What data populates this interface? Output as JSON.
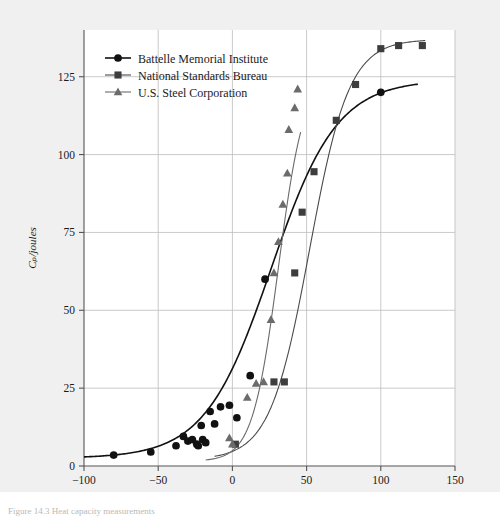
{
  "figure": {
    "background_color": "#f0f0f0",
    "plot_background_color": "#ffffff",
    "caption": "Figure 14.3   Heat capacity measurements"
  },
  "chart_data": {
    "type": "scatter",
    "title": "",
    "xlabel": "temperature/°C",
    "ylabel": "Cₚ/joules",
    "xlim": [
      -100,
      150
    ],
    "ylim": [
      0,
      140
    ],
    "xticks": [
      -100,
      -50,
      0,
      50,
      100,
      150
    ],
    "xticklabels": [
      "−100",
      "−50",
      "0",
      "50",
      "100",
      "150"
    ],
    "yticks": [
      0,
      25,
      50,
      75,
      100,
      125
    ],
    "yticklabels": [
      "0",
      "25",
      "50",
      "75",
      "100",
      "125"
    ],
    "grid": true,
    "legend_position": "upper-left",
    "series": [
      {
        "name": "Battelle Memorial Institute",
        "marker": "circle",
        "color": "#111111",
        "line_color": "#111111",
        "points": [
          {
            "x": -80,
            "y": 3.5
          },
          {
            "x": -55,
            "y": 4.5
          },
          {
            "x": -38,
            "y": 6.5
          },
          {
            "x": -33,
            "y": 9.5
          },
          {
            "x": -30,
            "y": 8.0
          },
          {
            "x": -27,
            "y": 8.5
          },
          {
            "x": -24,
            "y": 7.0
          },
          {
            "x": -23,
            "y": 6.5
          },
          {
            "x": -21,
            "y": 13.0
          },
          {
            "x": -20,
            "y": 8.5
          },
          {
            "x": -18,
            "y": 7.5
          },
          {
            "x": -15,
            "y": 17.5
          },
          {
            "x": -12,
            "y": 13.5
          },
          {
            "x": -8,
            "y": 19.0
          },
          {
            "x": -2,
            "y": 19.5
          },
          {
            "x": 3,
            "y": 15.5
          },
          {
            "x": 12,
            "y": 29.0
          },
          {
            "x": 22,
            "y": 60.0
          },
          {
            "x": 100,
            "y": 120.0
          }
        ],
        "curve": "sigmoid"
      },
      {
        "name": "National Standards Bureau",
        "marker": "square",
        "color": "#3d3d3d",
        "line_color": "#4a4a4a",
        "points": [
          {
            "x": 2,
            "y": 7.0
          },
          {
            "x": 28,
            "y": 27.0
          },
          {
            "x": 35,
            "y": 27.0
          },
          {
            "x": 42,
            "y": 62.0
          },
          {
            "x": 47,
            "y": 81.5
          },
          {
            "x": 55,
            "y": 94.5
          },
          {
            "x": 70,
            "y": 111.0
          },
          {
            "x": 83,
            "y": 122.5
          },
          {
            "x": 100,
            "y": 134.0
          },
          {
            "x": 112,
            "y": 135.0
          },
          {
            "x": 128,
            "y": 135.0
          }
        ],
        "curve": "sigmoid"
      },
      {
        "name": "U.S. Steel Corporation",
        "marker": "triangle",
        "color": "#6b6b6b",
        "line_color": "#6b6b6b",
        "points": [
          {
            "x": -2,
            "y": 9.0
          },
          {
            "x": 0,
            "y": 7.0
          },
          {
            "x": 10,
            "y": 22.0
          },
          {
            "x": 16,
            "y": 26.5
          },
          {
            "x": 21,
            "y": 27.0
          },
          {
            "x": 26,
            "y": 47.0
          },
          {
            "x": 28,
            "y": 62.0
          },
          {
            "x": 31,
            "y": 72.0
          },
          {
            "x": 34,
            "y": 84.0
          },
          {
            "x": 37,
            "y": 94.0
          },
          {
            "x": 38,
            "y": 108.0
          },
          {
            "x": 42,
            "y": 115.0
          },
          {
            "x": 44,
            "y": 121.0
          }
        ],
        "curve": "sigmoid"
      }
    ]
  }
}
